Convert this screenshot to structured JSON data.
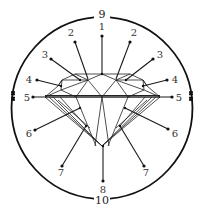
{
  "diagram": {
    "type": "diamond-anatomy",
    "circle": {
      "cx": 102,
      "cy": 108,
      "r": 91,
      "color": "#111111"
    },
    "circle_labels": [
      {
        "id": "9",
        "text": "9",
        "x": 102,
        "y": 18
      },
      {
        "id": "10",
        "text": "10",
        "x": 102,
        "y": 204
      }
    ],
    "callouts": [
      {
        "id": "1",
        "text": "1",
        "lx": 102,
        "ly": 30,
        "dot": [
          102,
          36
        ],
        "target": [
          102,
          74
        ]
      },
      {
        "id": "2L",
        "text": "2",
        "lx": 71,
        "ly": 36,
        "dot": [
          75,
          42
        ],
        "target": [
          88,
          79
        ]
      },
      {
        "id": "2R",
        "text": "2",
        "lx": 134,
        "ly": 36,
        "dot": [
          130,
          42
        ],
        "target": [
          116,
          79
        ]
      },
      {
        "id": "3L",
        "text": "3",
        "lx": 45,
        "ly": 58,
        "dot": [
          51,
          59
        ],
        "target": [
          80,
          80
        ]
      },
      {
        "id": "3R",
        "text": "3",
        "lx": 160,
        "ly": 58,
        "dot": [
          153,
          59
        ],
        "target": [
          126,
          80
        ]
      },
      {
        "id": "4L",
        "text": "4",
        "lx": 29,
        "ly": 83,
        "dot": [
          37,
          80
        ],
        "target": [
          61,
          86
        ]
      },
      {
        "id": "4R",
        "text": "4",
        "lx": 175,
        "ly": 83,
        "dot": [
          167,
          80
        ],
        "target": [
          143,
          86
        ]
      },
      {
        "id": "5L",
        "text": "5",
        "lx": 27,
        "ly": 101,
        "dot": [
          33,
          97
        ],
        "target": [
          46,
          97
        ]
      },
      {
        "id": "5R",
        "text": "5",
        "lx": 179,
        "ly": 101,
        "dot": [
          172,
          97
        ],
        "target": [
          159,
          97
        ]
      },
      {
        "id": "6L",
        "text": "6",
        "lx": 29,
        "ly": 137,
        "dot": [
          35,
          130
        ],
        "target": [
          80,
          108
        ]
      },
      {
        "id": "6R",
        "text": "6",
        "lx": 175,
        "ly": 137,
        "dot": [
          168,
          129
        ],
        "target": [
          125,
          108
        ]
      },
      {
        "id": "7L",
        "text": "7",
        "lx": 61,
        "ly": 176,
        "dot": [
          62,
          166
        ],
        "target": [
          86,
          126
        ]
      },
      {
        "id": "7R",
        "text": "7",
        "lx": 146,
        "ly": 176,
        "dot": [
          144,
          166
        ],
        "target": [
          120,
          126
        ]
      },
      {
        "id": "8",
        "text": "8",
        "lx": 103,
        "ly": 193,
        "dot": [
          103,
          181
        ],
        "target": [
          103,
          146
        ]
      }
    ],
    "girdle_markers": [
      {
        "side": "left",
        "x": 13,
        "y1": 92,
        "y2": 100
      },
      {
        "side": "right",
        "x": 191,
        "y1": 92,
        "y2": 100
      }
    ]
  }
}
